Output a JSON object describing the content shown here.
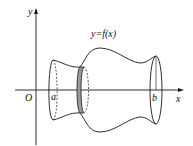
{
  "diagram": {
    "type": "solid-of-revolution",
    "axes": {
      "x_label": "x",
      "y_label": "y",
      "origin_label": "O"
    },
    "curve_label": "y=f(x)",
    "bounds": {
      "a_label": "a",
      "b_label": "b"
    },
    "colors": {
      "stroke": "#1a1a1a",
      "slice_fill": "#9a9a9a"
    }
  }
}
